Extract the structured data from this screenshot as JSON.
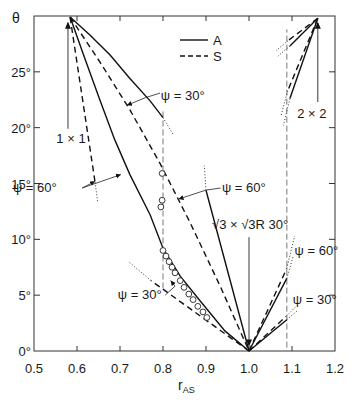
{
  "chart_data": {
    "type": "line",
    "title": "",
    "xlabel": {
      "main": "r",
      "sub": "AS"
    },
    "ylabel": "θ",
    "xlim": [
      0.5,
      1.2
    ],
    "ylim": [
      0,
      30
    ],
    "grid": false,
    "x_ticks": [
      {
        "value": 0.5,
        "label": "0.5"
      },
      {
        "value": 0.6,
        "label": "0.6"
      },
      {
        "value": 0.7,
        "label": "0.7"
      },
      {
        "value": 0.8,
        "label": "0.8"
      },
      {
        "value": 0.9,
        "label": "0.9"
      },
      {
        "value": 1.0,
        "label": "1.0"
      },
      {
        "value": 1.1,
        "label": "1.1"
      },
      {
        "value": 1.2,
        "label": "1.2"
      }
    ],
    "y_ticks": [
      {
        "value": 0,
        "label": "0°"
      },
      {
        "value": 5,
        "label": "5°"
      },
      {
        "value": 10,
        "label": "10°"
      },
      {
        "value": 15,
        "label": "15°"
      },
      {
        "value": 20,
        "label": "20°"
      },
      {
        "value": 25,
        "label": "25°"
      }
    ],
    "legend": {
      "position": "upper-center",
      "entries": [
        {
          "label": "A",
          "style": "solid"
        },
        {
          "label": "S",
          "style": "dashed"
        }
      ]
    },
    "series": [
      {
        "name": "A 1×1 ψ=30°",
        "structure": "1×1",
        "psi": 30,
        "model": "A",
        "style": "solid",
        "points": [
          [
            0.584,
            29.9
          ],
          [
            0.63,
            28.3
          ],
          [
            0.677,
            26.5
          ],
          [
            0.723,
            24.4
          ],
          [
            0.77,
            22.4
          ],
          [
            0.8,
            20.9
          ]
        ],
        "extension": [
          [
            0.8,
            20.9
          ],
          [
            0.825,
            19.3
          ]
        ]
      },
      {
        "name": "S 1×1 → √3×√3R30° (dashed)",
        "structure": "1×1",
        "psi": 30,
        "model": "S",
        "style": "dashed",
        "points": [
          [
            0.584,
            29.9
          ],
          [
            0.653,
            25.9
          ],
          [
            0.723,
            21.6
          ],
          [
            0.793,
            16.8
          ],
          [
            0.863,
            11.5
          ],
          [
            0.933,
            5.8
          ],
          [
            1.0,
            0.0
          ]
        ],
        "extension": []
      },
      {
        "name": "A 1×1 ψ=60° → √3×√3R30°",
        "structure": "1×1",
        "psi": 60,
        "model": "A",
        "style": "solid",
        "points": [
          [
            0.584,
            29.9
          ],
          [
            0.619,
            26.1
          ],
          [
            0.653,
            22.5
          ],
          [
            0.688,
            18.9
          ],
          [
            0.723,
            15.8
          ],
          [
            0.77,
            12.2
          ],
          [
            0.8,
            9.2
          ],
          [
            0.84,
            6.7
          ],
          [
            0.886,
            4.5
          ],
          [
            0.944,
            1.8
          ],
          [
            1.0,
            0.0
          ]
        ],
        "extension": []
      },
      {
        "name": "S 1×1 ψ=60°",
        "structure": "1×1",
        "psi": 60,
        "model": "S",
        "style": "dashed",
        "points": [
          [
            0.584,
            29.9
          ],
          [
            0.642,
            15.1
          ]
        ],
        "extension": [
          [
            0.642,
            15.1
          ],
          [
            0.648,
            13.4
          ]
        ]
      },
      {
        "name": "A √3×√3R30° ψ=60°",
        "structure": "√3×√3R30°",
        "psi": 60,
        "model": "A",
        "style": "solid",
        "points": [
          [
            1.0,
            0.0
          ],
          [
            0.9,
            14.4
          ]
        ],
        "extension": [
          [
            0.9,
            14.4
          ],
          [
            0.896,
            16.6
          ]
        ]
      },
      {
        "name": "S √3×√3R30° ψ=30°",
        "structure": "√3×√3R30°",
        "psi": 30,
        "model": "S",
        "style": "dashed",
        "points": [
          [
            1.0,
            0.0
          ],
          [
            0.772,
            6.3
          ]
        ],
        "extension": [
          [
            0.772,
            6.3
          ],
          [
            0.72,
            8.0
          ]
        ]
      },
      {
        "name": "S √3×√3R30° ψ=60° (right)",
        "structure": "√3×√3R30°",
        "psi": 60,
        "model": "S",
        "style": "dashed",
        "points": [
          [
            1.0,
            0.0
          ],
          [
            1.088,
            7.4
          ]
        ],
        "extension": [
          [
            1.088,
            7.4
          ],
          [
            1.106,
            10.3
          ]
        ]
      },
      {
        "name": "A √3×√3R30° ψ=60° (right)",
        "structure": "√3×√3R30°",
        "psi": 60,
        "model": "A",
        "style": "solid",
        "points": [
          [
            1.0,
            0.0
          ],
          [
            1.088,
            6.5
          ]
        ],
        "extension": [
          [
            1.088,
            6.5
          ],
          [
            1.102,
            8.4
          ]
        ]
      },
      {
        "name": "A √3×√3R30° ψ=30° (right)",
        "structure": "√3×√3R30°",
        "psi": 30,
        "model": "A",
        "style": "solid",
        "points": [
          [
            1.0,
            0.0
          ],
          [
            1.088,
            2.8
          ]
        ],
        "extension": [
          [
            1.088,
            2.8
          ],
          [
            1.112,
            3.6
          ]
        ]
      },
      {
        "name": "S √3×√3R30° ψ=30° (right)",
        "structure": "√3×√3R30°",
        "psi": 30,
        "model": "S",
        "style": "dashed",
        "points": [
          [
            1.0,
            0.0
          ],
          [
            1.086,
            3.1
          ]
        ],
        "extension": [
          [
            1.086,
            3.1
          ],
          [
            1.11,
            4.0
          ]
        ]
      },
      {
        "name": "A 2×2 ψ=30°",
        "structure": "2×2",
        "psi": 30,
        "model": "A",
        "style": "solid",
        "points": [
          [
            1.16,
            29.8
          ],
          [
            1.095,
            27.3
          ]
        ],
        "extension": [
          [
            1.095,
            27.3
          ],
          [
            1.067,
            26.4
          ]
        ]
      },
      {
        "name": "S 2×2 ψ=30°",
        "structure": "2×2",
        "psi": 30,
        "model": "S",
        "style": "dashed",
        "points": [
          [
            1.16,
            29.8
          ],
          [
            1.091,
            27.8
          ]
        ],
        "extension": [
          [
            1.091,
            27.8
          ],
          [
            1.063,
            26.9
          ]
        ]
      },
      {
        "name": "A 2×2 ψ=60°",
        "structure": "2×2",
        "psi": 60,
        "model": "A",
        "style": "solid",
        "points": [
          [
            1.16,
            29.8
          ],
          [
            1.095,
            22.6
          ]
        ],
        "extension": [
          [
            1.095,
            22.6
          ],
          [
            1.08,
            20.2
          ]
        ]
      },
      {
        "name": "S 2×2 ψ=60°",
        "structure": "2×2",
        "psi": 60,
        "model": "S",
        "style": "dashed",
        "points": [
          [
            1.16,
            29.8
          ],
          [
            1.09,
            23.3
          ]
        ],
        "extension": [
          [
            1.09,
            23.3
          ],
          [
            1.074,
            21.0
          ]
        ]
      }
    ],
    "markers": {
      "style": "open-circle",
      "points": [
        [
          0.798,
          15.9
        ],
        [
          0.798,
          13.5
        ],
        [
          0.795,
          12.9
        ],
        [
          0.8,
          9.0
        ],
        [
          0.807,
          8.5
        ],
        [
          0.814,
          8.0
        ],
        [
          0.821,
          7.5
        ],
        [
          0.828,
          7.0
        ],
        [
          0.84,
          6.3
        ],
        [
          0.849,
          5.7
        ],
        [
          0.86,
          5.1
        ],
        [
          0.87,
          4.6
        ],
        [
          0.881,
          4.0
        ],
        [
          0.893,
          3.5
        ],
        [
          0.902,
          3.0
        ]
      ]
    },
    "reference_lines": [
      {
        "r": 0.8,
        "theta": [
          5.6,
          21.7
        ]
      },
      {
        "r": 1.088,
        "theta": [
          0.3,
          28.8
        ]
      }
    ],
    "arrows": [
      {
        "label_ref": "1x1",
        "from": [
          0.579,
          19.9
        ],
        "to": [
          0.579,
          29.4
        ]
      },
      {
        "label_ref": "2x2",
        "from": [
          1.16,
          22.3
        ],
        "to": [
          1.16,
          29.4
        ]
      },
      {
        "label_ref": "sqrt3",
        "from": [
          1.0,
          10.2
        ],
        "to": [
          1.0,
          0.5
        ]
      }
    ],
    "leaders": [
      {
        "points": [
          [
            0.793,
            23.1
          ],
          [
            0.76,
            22.7
          ],
          [
            0.716,
            22.0
          ]
        ]
      },
      {
        "points": [
          [
            0.612,
            14.6
          ],
          [
            0.642,
            15.2
          ]
        ]
      },
      {
        "points": [
          [
            0.612,
            14.6
          ],
          [
            0.702,
            15.8
          ]
        ]
      },
      {
        "points": [
          [
            0.934,
            14.6
          ],
          [
            0.899,
            14.4
          ],
          [
            0.836,
            13.6
          ]
        ]
      },
      {
        "points": [
          [
            0.805,
            5.0
          ],
          [
            0.828,
            5.8
          ],
          [
            0.818,
            6.3
          ]
        ]
      }
    ],
    "annotations": [
      {
        "id": "1x1",
        "text": "1 × 1",
        "r": 0.552,
        "theta": 18.6
      },
      {
        "id": "psi30-top",
        "text": "ψ = 30°",
        "r": 0.795,
        "theta": 22.5
      },
      {
        "id": "psi60-left",
        "text": "ψ = 60°",
        "r": 0.451,
        "theta": 14.2
      },
      {
        "id": "psi60-mid",
        "text": "ψ = 60°",
        "r": 0.937,
        "theta": 14.2
      },
      {
        "id": "sqrt3",
        "text": "√3 × √3R 30°",
        "r": 0.914,
        "theta": 10.9
      },
      {
        "id": "psi60-right",
        "text": "ψ = 60°",
        "r": 1.106,
        "theta": 8.6
      },
      {
        "id": "psi30-right",
        "text": "ψ = 30°",
        "r": 1.102,
        "theta": 4.2
      },
      {
        "id": "psi30-low",
        "text": "ψ = 30°",
        "r": 0.695,
        "theta": 4.7
      },
      {
        "id": "2x2",
        "text": "2 × 2",
        "r": 1.112,
        "theta": 20.9
      }
    ]
  }
}
